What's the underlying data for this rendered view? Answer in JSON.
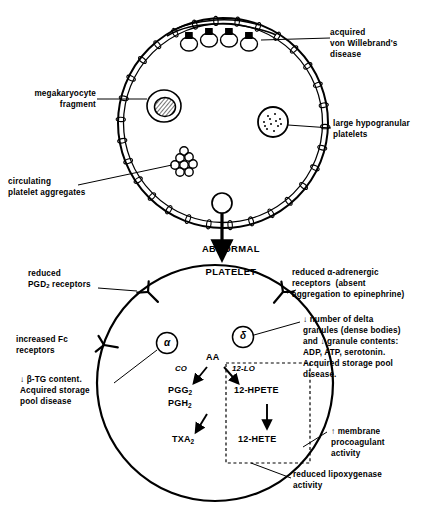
{
  "diagram": {
    "ink_color": "#000000",
    "background": "#ffffff"
  },
  "top_cell": {
    "name": "blood-vessel-or-circulating-compartment",
    "inclusions": [
      {
        "id": "megakaryocyte-fragment",
        "shape": "hatched-oval-in-vacuole"
      },
      {
        "id": "large-hypogranular-platelet",
        "shape": "stippled-circle"
      },
      {
        "id": "platelet-aggregate",
        "shape": "cluster-of-small-circles"
      },
      {
        "id": "normal-platelet",
        "shape": "plain-small-circle"
      }
    ],
    "membrane_receptors": {
      "count": 4,
      "cap": "filled-square",
      "strand": "von-willebrand-multimer"
    }
  },
  "labels_top": [
    {
      "id": "acquired-von-willebrand",
      "text": "acquired\nvon Willebrand's\ndisease",
      "align": "left"
    },
    {
      "id": "megakaryocyte-fragment",
      "text": "megakaryocyte\nfragment",
      "align": "left"
    },
    {
      "id": "large-hypogranular-platelets",
      "text": "large hypogranular\nplatelets",
      "align": "left"
    },
    {
      "id": "circulating-platelet-aggregates",
      "text": "circulating\nplatelet aggregates",
      "align": "left"
    }
  ],
  "transition": {
    "arrow": "down",
    "text_line1": "ABNORMAL",
    "text_line2": "PLATELET"
  },
  "bottom_cell": {
    "name": "abnormal-platelet",
    "granules": [
      {
        "id": "alpha-granule",
        "symbol": "α"
      },
      {
        "id": "delta-granule",
        "symbol": "δ"
      }
    ],
    "surface_receptors": [
      {
        "id": "pgd2-receptor",
        "position": "upper-left"
      },
      {
        "id": "fc-receptor",
        "position": "mid-left"
      },
      {
        "id": "alpha-adrenergic-receptor",
        "position": "upper-right"
      }
    ]
  },
  "labels_bottom": [
    {
      "id": "reduced-pgd2-receptors",
      "line1": "reduced",
      "line2_pre": "PGD",
      "line2_sub": "2",
      "line2_post": " receptors"
    },
    {
      "id": "increased-fc-receptors",
      "text": "increased Fc\nreceptors"
    },
    {
      "id": "reduced-alpha-adrenergic",
      "text": "reduced α-adrenergic\nreceptors  (absent\naggregation to epinephrine)"
    },
    {
      "id": "beta-tg-content",
      "text": "↓ β-TG content.\nAcquired storage\npool disease"
    },
    {
      "id": "delta-granule-note",
      "text": "↓ number of delta\ngranules (dense bodies)\nand ↓ granule contents:\nADP, ATP, serotonin.\nAcquired storage pool\ndisease."
    },
    {
      "id": "membrane-procoagulant",
      "text": "↑ membrane\nprocoagulant\nactivity"
    },
    {
      "id": "reduced-lipoxygenase",
      "text": "reduced lipoxygenase\nactivity"
    }
  ],
  "pathway": {
    "substrate": "AA",
    "enzyme_co": "CO",
    "enzyme_lo": "12-LO",
    "co_products_1_base": "PGG",
    "co_products_1_sub": "2",
    "co_products_2_base": "PGH",
    "co_products_2_sub": "2",
    "co_end_base": "TXA",
    "co_end_sub": "2",
    "lo_product_1": "12-HPETE",
    "lo_product_2": "12-HETE",
    "dashed_box": "reduced-lipoxygenase-region"
  }
}
